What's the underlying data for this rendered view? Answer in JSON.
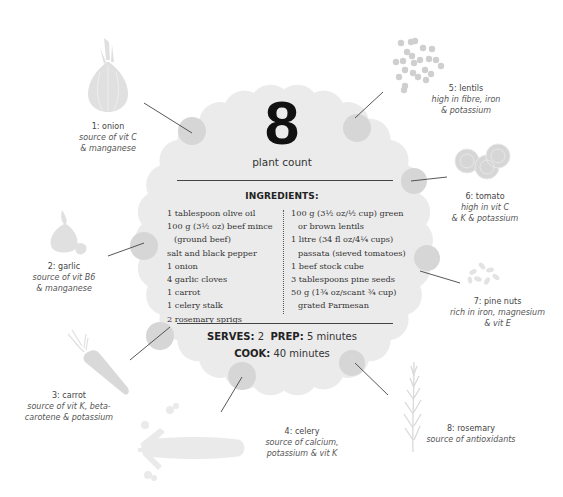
{
  "header": {
    "plant_count": "8",
    "plant_count_label": "plant count"
  },
  "ingredients": {
    "title": "INGREDIENTS:",
    "left": [
      {
        "text": "1 tablespoon olive oil",
        "indent": false
      },
      {
        "text": "100 g (3½ oz) beef mince",
        "indent": false
      },
      {
        "text": "(ground beef)",
        "indent": true
      },
      {
        "text": "salt and black pepper",
        "indent": false
      },
      {
        "text": "1 onion",
        "indent": false
      },
      {
        "text": "4 garlic cloves",
        "indent": false
      },
      {
        "text": "1 carrot",
        "indent": false
      },
      {
        "text": "1 celery stalk",
        "indent": false
      },
      {
        "text": "2 rosemary sprigs",
        "indent": false
      }
    ],
    "right": [
      {
        "text": "100 g (3½ oz/½ cup) green",
        "indent": false
      },
      {
        "text": "or brown lentils",
        "indent": true
      },
      {
        "text": "1 litre (34 fl oz/4¼ cups)",
        "indent": false
      },
      {
        "text": "passata (sieved tomatoes)",
        "indent": true
      },
      {
        "text": "1 beef stock cube",
        "indent": false
      },
      {
        "text": "3 tablespoons pine seeds",
        "indent": false
      },
      {
        "text": "50 g (1¾ oz/scant ¾ cup)",
        "indent": false
      },
      {
        "text": "grated Parmesan",
        "indent": true
      }
    ]
  },
  "meta": {
    "serves_label": "SERVES:",
    "serves_value": "2",
    "prep_label": "PREP:",
    "prep_value": "5 minutes",
    "cook_label": "COOK:",
    "cook_value": "40 minutes"
  },
  "plants": [
    {
      "name": "1: onion",
      "desc": [
        "source of vit C",
        "& manganese"
      ],
      "icon": "onion-icon"
    },
    {
      "name": "2: garlic",
      "desc": [
        "source of vit B6",
        "& manganese"
      ],
      "icon": "garlic-icon"
    },
    {
      "name": "3: carrot",
      "desc": [
        "source of vit K, beta-",
        "carotene & potassium"
      ],
      "icon": "carrot-icon"
    },
    {
      "name": "4: celery",
      "desc": [
        "source of calcium,",
        "potassium & vit K"
      ],
      "icon": "celery-icon"
    },
    {
      "name": "5: lentils",
      "desc": [
        "high in fibre, iron",
        "& potassium"
      ],
      "icon": "lentils-icon"
    },
    {
      "name": "6: tomato",
      "desc": [
        "high in vit C",
        "& K & potassium"
      ],
      "icon": "tomato-icon"
    },
    {
      "name": "7: pine nuts",
      "desc": [
        "rich in iron, magnesium",
        "& vit E"
      ],
      "icon": "pine-nuts-icon"
    },
    {
      "name": "8: rosemary",
      "desc": [
        "source of antioxidants"
      ],
      "icon": "rosemary-icon"
    }
  ],
  "colors": {
    "blob": "#ebebeb",
    "callout_dot": "#d6d6d6",
    "illustration": "#d9d9d9",
    "text": "#333333"
  }
}
